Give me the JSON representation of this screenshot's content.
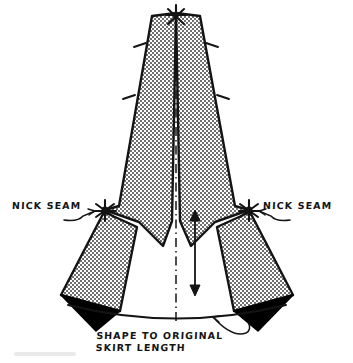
{
  "diagram": {
    "type": "sewing-pattern-illustration",
    "canvas": {
      "width": 353,
      "height": 363,
      "background": "#ffffff"
    },
    "colors": {
      "ink": "#141414",
      "stipple_fill": "#a8a8a8",
      "excess_wedge": "#000000",
      "paper": "#ffffff"
    },
    "labels": {
      "nick_seam_left": "NICK SEAM",
      "nick_seam_right": "NICK SEAM",
      "caption_line_1": "SHAPE TO ORIGINAL",
      "caption_line_2": "SKIRT LENGTH"
    },
    "markers": {
      "apex_nick_star": "nick-star-marker",
      "left_pivot_star": "nick-star-marker",
      "right_pivot_star": "nick-star-marker",
      "seam_tick": "seam-tick-mark",
      "length_arrow": "double-headed-arrow",
      "center_line": "dash-dot-fold-line",
      "hem_arc": "original-hem-curve"
    },
    "geometry": {
      "apex": [
        176,
        12
      ],
      "left_pivot": [
        105,
        210
      ],
      "right_pivot": [
        249,
        210
      ],
      "center_line": [
        [
          176,
          14
        ],
        [
          176,
          322
        ]
      ],
      "length_arrow": [
        [
          195,
          212
        ],
        [
          195,
          292
        ]
      ],
      "main_panel_left": "M176,13 L152,16 L119,206 L105,210 L139,222 L163,245 L172,222 Z",
      "main_panel_right": "M176,13 L200,16 L235,206 L249,210 L215,222 L191,245 L180,222 Z",
      "rotated_panel_left": "M104,211 L136,226 L121,310 L62,296 Z",
      "rotated_panel_right": "M250,211 L218,226 L233,310 L292,296 Z",
      "excess_wedge_left": "M62,296 L121,310 L95,330 Z",
      "excess_wedge_right": "M292,296 L233,310 L259,330 Z",
      "hem_arc": "M71,308 Q176,330 284,308",
      "seam_ticks_left": [
        [
          141,
          44
        ],
        [
          129,
          96
        ]
      ],
      "seam_ticks_right": [
        [
          211,
          44
        ],
        [
          223,
          96
        ]
      ]
    }
  }
}
